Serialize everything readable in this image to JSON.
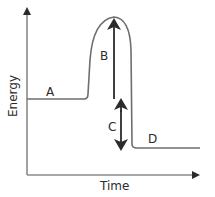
{
  "diagram": {
    "type": "energy-profile",
    "axes": {
      "y_label": "Energy",
      "x_label": "Time"
    },
    "labels": {
      "a": "A",
      "b": "B",
      "c": "C",
      "d": "D"
    },
    "colors": {
      "axis": "#8a8a8a",
      "curve": "#6e6e6e",
      "arrow": "#2b2b2b",
      "text": "#2b2b2b",
      "background": "#ffffff"
    }
  }
}
